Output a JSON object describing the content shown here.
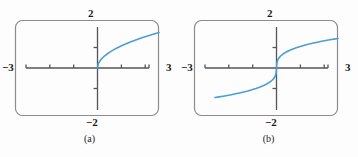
{
  "figure": {
    "background": "#fdfdfd",
    "width": 358,
    "height": 157
  },
  "style": {
    "curve_color": "#4a9fd4",
    "frame_color": "#8c8c8c",
    "axis_color": "#555555",
    "text_color": "#1a1a1a"
  },
  "panels": [
    {
      "id": "a",
      "caption": "(a)",
      "labels": {
        "top": "2",
        "bottom": "−2",
        "left": "−3",
        "right": "3"
      },
      "chart_data": {
        "type": "line",
        "title": "",
        "subtitle": "",
        "xlabel": "",
        "ylabel": "",
        "xlim": [
          -3,
          3
        ],
        "ylim": [
          -2,
          2
        ],
        "grid": false,
        "legend": "none",
        "xticks": [
          -3,
          -2,
          -1,
          0,
          1,
          2,
          3
        ],
        "yticks": [
          -2,
          -1,
          0,
          1,
          2
        ],
        "xticklabels": [
          "−3",
          "",
          "",
          "",
          "",
          "",
          "3"
        ],
        "yticklabels": [
          "−2",
          "",
          "",
          "",
          "2"
        ],
        "series": [
          {
            "name": "sqrt(x)",
            "x": [
              0.0,
              0.03,
              0.06,
              0.09,
              0.12,
              0.15,
              0.2,
              0.25,
              0.3,
              0.35,
              0.4,
              0.5,
              0.6,
              0.7,
              0.8,
              0.9,
              1.0,
              1.2,
              1.4,
              1.6,
              1.8,
              2.0,
              2.2,
              2.4,
              2.6,
              2.8,
              3.0
            ],
            "y": [
              0.0,
              0.173,
              0.245,
              0.3,
              0.346,
              0.387,
              0.447,
              0.5,
              0.548,
              0.592,
              0.632,
              0.707,
              0.775,
              0.837,
              0.894,
              0.949,
              1.0,
              1.095,
              1.183,
              1.265,
              1.342,
              1.414,
              1.483,
              1.549,
              1.612,
              1.673,
              1.732
            ]
          }
        ]
      }
    },
    {
      "id": "b",
      "caption": "(b)",
      "labels": {
        "top": "2",
        "bottom": "−2",
        "left": "−3",
        "right": "3"
      },
      "chart_data": {
        "type": "line",
        "title": "",
        "subtitle": "",
        "xlabel": "",
        "ylabel": "",
        "xlim": [
          -3,
          3
        ],
        "ylim": [
          -2,
          2
        ],
        "grid": false,
        "legend": "none",
        "xticks": [
          -3,
          -2,
          -1,
          0,
          1,
          2,
          3
        ],
        "yticks": [
          -2,
          -1,
          0,
          1,
          2
        ],
        "xticklabels": [
          "−3",
          "",
          "",
          "",
          "",
          "",
          "3"
        ],
        "yticklabels": [
          "−2",
          "",
          "",
          "",
          "2"
        ],
        "series": [
          {
            "name": "cbrt(x)",
            "x": [
              -3.0,
              -2.8,
              -2.6,
              -2.4,
              -2.2,
              -2.0,
              -1.8,
              -1.6,
              -1.4,
              -1.2,
              -1.0,
              -0.8,
              -0.6,
              -0.45,
              -0.3,
              -0.2,
              -0.12,
              -0.06,
              -0.02,
              0.0,
              0.02,
              0.06,
              0.12,
              0.2,
              0.3,
              0.45,
              0.6,
              0.8,
              1.0,
              1.2,
              1.4,
              1.6,
              1.8,
              2.0,
              2.2,
              2.4,
              2.6,
              2.8,
              3.0
            ],
            "y": [
              -1.442,
              -1.409,
              -1.375,
              -1.339,
              -1.301,
              -1.26,
              -1.216,
              -1.17,
              -1.119,
              -1.063,
              -1.0,
              -0.928,
              -0.843,
              -0.766,
              -0.669,
              -0.585,
              -0.493,
              -0.391,
              -0.271,
              0.0,
              0.271,
              0.391,
              0.493,
              0.585,
              0.669,
              0.766,
              0.843,
              0.928,
              1.0,
              1.063,
              1.119,
              1.17,
              1.216,
              1.26,
              1.301,
              1.339,
              1.375,
              1.409,
              1.442
            ]
          }
        ]
      }
    }
  ]
}
